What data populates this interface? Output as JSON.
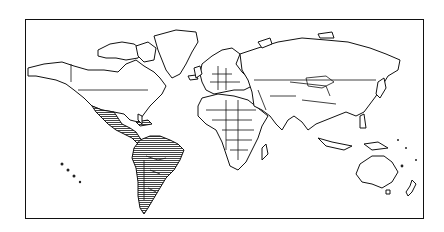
{
  "map": {
    "type": "world-outline",
    "projection": "equirectangular-like",
    "highlight": {
      "regions": [
        "Mexico",
        "Central America",
        "Caribbean",
        "South America"
      ],
      "fill_style": "horizontal hatching",
      "color": "#555555"
    },
    "outline_color": "#111111",
    "background_color": "#ffffff"
  }
}
